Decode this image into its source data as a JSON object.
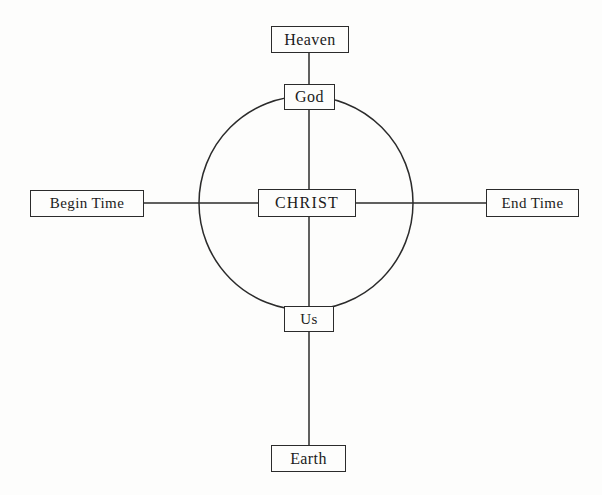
{
  "diagram": {
    "colors": {
      "stroke": "#2b2b2b",
      "background": "#fdfdfc",
      "text": "#1b1b1b"
    },
    "circle": {
      "center_x": 306,
      "center_y": 203,
      "radius": 107
    },
    "nodes": [
      {
        "id": "heaven",
        "label": "Heaven",
        "x": 310,
        "y": 39
      },
      {
        "id": "god",
        "label": "God",
        "x": 309,
        "y": 97
      },
      {
        "id": "christ",
        "label": "CHRIST",
        "x": 307,
        "y": 203
      },
      {
        "id": "begin_time",
        "label": "Begin Time",
        "x": 87,
        "y": 203
      },
      {
        "id": "end_time",
        "label": "End Time",
        "x": 532,
        "y": 203
      },
      {
        "id": "us",
        "label": "Us",
        "x": 309,
        "y": 319
      },
      {
        "id": "earth",
        "label": "Earth",
        "x": 308,
        "y": 458
      }
    ],
    "connectors": [
      {
        "id": "heaven-god",
        "from": "heaven",
        "to": "god",
        "orientation": "vertical"
      },
      {
        "id": "god-christ",
        "from": "god",
        "to": "christ",
        "orientation": "vertical"
      },
      {
        "id": "christ-us",
        "from": "christ",
        "to": "us",
        "orientation": "vertical"
      },
      {
        "id": "us-earth",
        "from": "us",
        "to": "earth",
        "orientation": "vertical"
      },
      {
        "id": "begin-christ",
        "from": "begin_time",
        "to": "christ",
        "orientation": "horizontal"
      },
      {
        "id": "christ-end",
        "from": "christ",
        "to": "end_time",
        "orientation": "horizontal"
      }
    ]
  }
}
